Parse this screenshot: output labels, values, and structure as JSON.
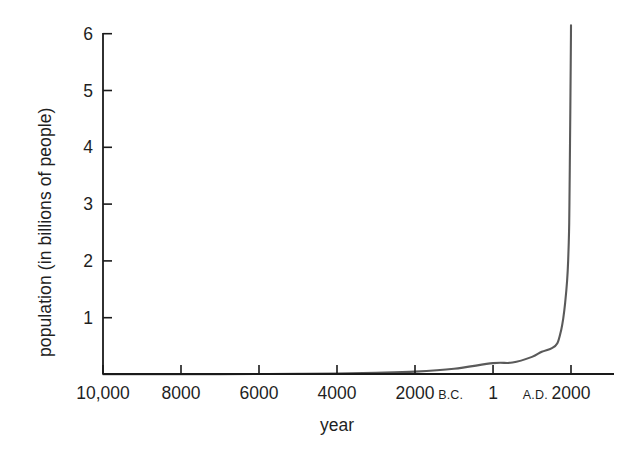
{
  "chart_data": {
    "type": "line",
    "title": "",
    "xlabel": "year",
    "ylabel": "population (in billions of people)",
    "ylim": [
      0,
      6.3
    ],
    "xlim": [
      -10000,
      2000
    ],
    "grid": false,
    "legend": null,
    "line_color": "#5a5a5a",
    "axis_color": "#1a1a1a",
    "y_ticks": [
      1,
      2,
      3,
      4,
      5,
      6
    ],
    "y_tick_labels": [
      "1",
      "2",
      "3",
      "4",
      "5",
      "6"
    ],
    "x_ticks": [
      -10000,
      -8000,
      -6000,
      -4000,
      -2000,
      1,
      2000
    ],
    "x_tick_labels": [
      {
        "number": "10,000",
        "era": "",
        "era_position": ""
      },
      {
        "number": "8000",
        "era": "",
        "era_position": ""
      },
      {
        "number": "6000",
        "era": "",
        "era_position": ""
      },
      {
        "number": "4000",
        "era": "",
        "era_position": ""
      },
      {
        "number": "2000",
        "era": "B.C.",
        "era_position": "after"
      },
      {
        "number": "1",
        "era": "",
        "era_position": ""
      },
      {
        "number": "2000",
        "era": "A.D.",
        "era_position": "before"
      }
    ],
    "x": [
      -10000,
      -9000,
      -8000,
      -7000,
      -6000,
      -5000,
      -4000,
      -3000,
      -2000,
      -1000,
      1,
      500,
      1000,
      1250,
      1500,
      1650,
      1750,
      1800,
      1850,
      1900,
      1927,
      1950,
      1960,
      1975,
      1987,
      1999,
      2000
    ],
    "y": [
      0.004,
      0.005,
      0.006,
      0.007,
      0.009,
      0.012,
      0.018,
      0.03,
      0.05,
      0.1,
      0.2,
      0.21,
      0.31,
      0.4,
      0.46,
      0.55,
      0.79,
      0.98,
      1.26,
      1.65,
      2.0,
      2.52,
      3.02,
      4.07,
      5.0,
      6.0,
      6.15
    ],
    "series_name": "world population"
  },
  "axes": {
    "y_axis_name": "population-axis",
    "x_axis_name": "year-axis"
  }
}
